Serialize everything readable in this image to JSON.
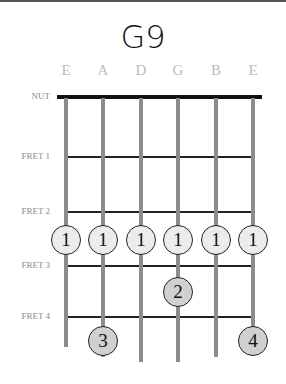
{
  "chord": {
    "name": "G9"
  },
  "strings": [
    {
      "name": "E",
      "x": 66,
      "end_y": 347
    },
    {
      "name": "A",
      "x": 103,
      "end_y": 357
    },
    {
      "name": "D",
      "x": 141,
      "end_y": 362
    },
    {
      "name": "G",
      "x": 178,
      "end_y": 362
    },
    {
      "name": "B",
      "x": 216,
      "end_y": 357
    },
    {
      "name": "E",
      "x": 253,
      "end_y": 347
    }
  ],
  "nut_label": "NUT",
  "frets": [
    {
      "label": "FRET 1",
      "y": 157
    },
    {
      "label": "FRET 2",
      "y": 212
    },
    {
      "label": "FRET 3",
      "y": 266
    },
    {
      "label": "FRET 4",
      "y": 317
    }
  ],
  "fingers": [
    {
      "finger": "1",
      "string": "E",
      "x": 66,
      "y": 240,
      "type": "barre"
    },
    {
      "finger": "1",
      "string": "A",
      "x": 103,
      "y": 240,
      "type": "barre"
    },
    {
      "finger": "1",
      "string": "D",
      "x": 141,
      "y": 240,
      "type": "barre"
    },
    {
      "finger": "1",
      "string": "G",
      "x": 178,
      "y": 240,
      "type": "barre"
    },
    {
      "finger": "1",
      "string": "B",
      "x": 216,
      "y": 240,
      "type": "barre"
    },
    {
      "finger": "1",
      "string": "E",
      "x": 253,
      "y": 240,
      "type": "barre"
    },
    {
      "finger": "2",
      "string": "G",
      "x": 178,
      "y": 292,
      "type": "finger"
    },
    {
      "finger": "3",
      "string": "A",
      "x": 103,
      "y": 341,
      "type": "finger"
    },
    {
      "finger": "4",
      "string": "E",
      "x": 253,
      "y": 341,
      "type": "finger"
    }
  ],
  "colors": {
    "barre_fill": "#ececec",
    "finger_fill": "#d0d0d0",
    "string": "#8c8c8c",
    "fret": "#222222",
    "nut": "#111111",
    "string_label": "#bdbdbd",
    "fret_label": "#8a8a8a"
  }
}
